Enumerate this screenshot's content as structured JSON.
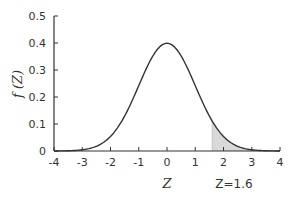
{
  "chart_data": {
    "type": "area",
    "title": "",
    "xlabel": "Z",
    "ylabel": "f (Z)",
    "xlim": [
      -4,
      4
    ],
    "ylim": [
      0,
      0.5
    ],
    "x_ticks": [
      "-4",
      "-3",
      "-2",
      "-1",
      "0",
      "1",
      "2",
      "3",
      "4"
    ],
    "y_ticks": [
      "0",
      "0.1",
      "0.2",
      "0.3",
      "0.4",
      "0.5"
    ],
    "grid": false,
    "legend": null,
    "series": [
      {
        "name": "Standard normal density",
        "function": "f(Z) = (1/sqrt(2*pi)) * exp(-Z^2/2)",
        "x": [
          -4,
          -3.5,
          -3,
          -2.5,
          -2,
          -1.5,
          -1,
          -0.5,
          0,
          0.5,
          1,
          1.5,
          2,
          2.5,
          3,
          3.5,
          4
        ],
        "values": [
          0.0001,
          0.0009,
          0.0044,
          0.0175,
          0.054,
          0.1295,
          0.242,
          0.3521,
          0.3989,
          0.3521,
          0.242,
          0.1295,
          0.054,
          0.0175,
          0.0044,
          0.0009,
          0.0001
        ]
      }
    ],
    "shaded_region": {
      "from": 1.6,
      "to": 4,
      "color": "#d9d9d9"
    },
    "annotations": [
      {
        "text": "Z=1.6",
        "x": 1.6
      }
    ]
  },
  "labels": {
    "x_title": "Z",
    "y_title": "f (Z)",
    "annotation": "Z=1.6"
  },
  "colors": {
    "curve": "#333333",
    "axis": "#333333",
    "shade": "#d9d9d9"
  }
}
